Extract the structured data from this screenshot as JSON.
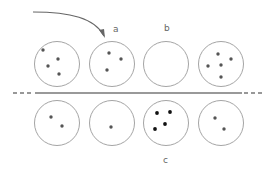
{
  "labels": {
    "a": "a",
    "b": "b",
    "c": "c"
  },
  "colors": {
    "circle_stroke": "#9a9a9a",
    "dot_grey": "#555555",
    "dot_black": "#111111",
    "line": "#777777",
    "arrow": "#666666"
  },
  "circle_radius": 22.5,
  "top_row": [
    {
      "id": "top-1",
      "cx": 57,
      "cy": 64,
      "dots": [
        [
          43,
          50
        ],
        [
          58,
          59
        ],
        [
          48,
          66
        ],
        [
          59,
          74
        ]
      ],
      "dot_color": "grey"
    },
    {
      "id": "top-2",
      "cx": 112,
      "cy": 64,
      "label": "a",
      "dots": [
        [
          109,
          53
        ],
        [
          121,
          59
        ],
        [
          107,
          70
        ]
      ],
      "dot_color": "grey"
    },
    {
      "id": "top-3",
      "cx": 166,
      "cy": 64,
      "label": "b",
      "dots": [],
      "dot_color": "grey"
    },
    {
      "id": "top-4",
      "cx": 221,
      "cy": 64,
      "dots": [
        [
          218,
          54
        ],
        [
          231,
          59
        ],
        [
          208,
          66
        ],
        [
          221,
          65
        ],
        [
          221,
          77
        ]
      ],
      "dot_color": "grey"
    }
  ],
  "bottom_row": [
    {
      "id": "bottom-1",
      "cx": 57,
      "cy": 123,
      "dots": [
        [
          51,
          117
        ],
        [
          62,
          126
        ]
      ],
      "dot_color": "grey"
    },
    {
      "id": "bottom-2",
      "cx": 112,
      "cy": 123,
      "dots": [
        [
          111,
          127
        ]
      ],
      "dot_color": "grey"
    },
    {
      "id": "bottom-3",
      "cx": 166,
      "cy": 123,
      "label": "c",
      "dots": [
        [
          157,
          113
        ],
        [
          170,
          112
        ],
        [
          165,
          124
        ],
        [
          155,
          129
        ]
      ],
      "dot_color": "black"
    },
    {
      "id": "bottom-4",
      "cx": 221,
      "cy": 123,
      "dots": [
        [
          215,
          118
        ],
        [
          224,
          129
        ]
      ],
      "dot_color": "grey"
    }
  ],
  "divider": {
    "y": 93,
    "solid_from": 35,
    "solid_to": 242,
    "dash_left_from": 13,
    "dash_right_to": 262
  },
  "arrow": {
    "path": "M 33 12 C 70 12, 95 18, 104 36",
    "head_at": [
      105,
      38
    ]
  }
}
